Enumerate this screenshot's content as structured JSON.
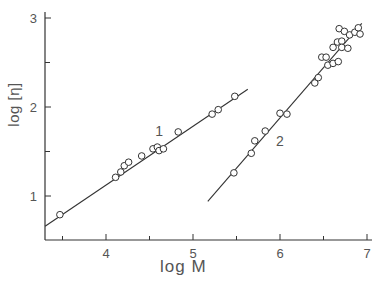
{
  "chart_data": {
    "type": "scatter",
    "title": "",
    "xlabel": "log M",
    "ylabel": "log [η]",
    "xlim": [
      3.3,
      7.0
    ],
    "ylim": [
      0.5,
      3.05
    ],
    "xticks": [
      4,
      5,
      6,
      7
    ],
    "yticks": [
      1,
      2,
      3
    ],
    "x_minor_ticks": [
      3.5,
      4.5,
      5.5,
      6.5
    ],
    "y_minor_ticks": [
      1.5,
      2.5
    ],
    "grid": false,
    "legend": null,
    "annotations": [
      {
        "text": "1",
        "x": 4.61,
        "y": 1.73
      },
      {
        "text": "2",
        "x": 6.0,
        "y": 1.62
      }
    ],
    "series": [
      {
        "name": "1",
        "marker": "open-circle",
        "points": [
          [
            3.47,
            0.79
          ],
          [
            4.11,
            1.21
          ],
          [
            4.17,
            1.27
          ],
          [
            4.21,
            1.34
          ],
          [
            4.26,
            1.38
          ],
          [
            4.41,
            1.45
          ],
          [
            4.54,
            1.53
          ],
          [
            4.59,
            1.55
          ],
          [
            4.61,
            1.51
          ],
          [
            4.66,
            1.53
          ],
          [
            4.83,
            1.72
          ],
          [
            5.22,
            1.92
          ],
          [
            5.29,
            1.97
          ],
          [
            5.48,
            2.12
          ]
        ],
        "fit_line": [
          [
            3.3,
            0.66
          ],
          [
            5.63,
            2.2
          ]
        ]
      },
      {
        "name": "2",
        "marker": "open-circle",
        "points": [
          [
            5.47,
            1.26
          ],
          [
            5.67,
            1.48
          ],
          [
            5.71,
            1.62
          ],
          [
            5.83,
            1.73
          ],
          [
            6.0,
            1.93
          ],
          [
            6.08,
            1.92
          ],
          [
            6.4,
            2.27
          ],
          [
            6.44,
            2.33
          ],
          [
            6.48,
            2.56
          ],
          [
            6.53,
            2.56
          ],
          [
            6.55,
            2.47
          ],
          [
            6.61,
            2.49
          ],
          [
            6.67,
            2.51
          ],
          [
            6.61,
            2.67
          ],
          [
            6.66,
            2.73
          ],
          [
            6.71,
            2.74
          ],
          [
            6.71,
            2.67
          ],
          [
            6.78,
            2.66
          ],
          [
            6.68,
            2.88
          ],
          [
            6.74,
            2.85
          ],
          [
            6.8,
            2.81
          ],
          [
            6.86,
            2.84
          ],
          [
            6.9,
            2.89
          ],
          [
            6.92,
            2.82
          ]
        ],
        "fit_line": [
          [
            5.17,
            0.94
          ],
          [
            6.94,
            2.94
          ]
        ]
      }
    ]
  },
  "axes": {
    "xlabel": "log M",
    "ylabel": "log [η]",
    "xtick_labels": [
      "4",
      "5",
      "6",
      "7"
    ],
    "ytick_labels": [
      "1",
      "2",
      "3"
    ]
  },
  "colors": {
    "ink": "#333333",
    "text": "#555555",
    "background": "#ffffff"
  }
}
